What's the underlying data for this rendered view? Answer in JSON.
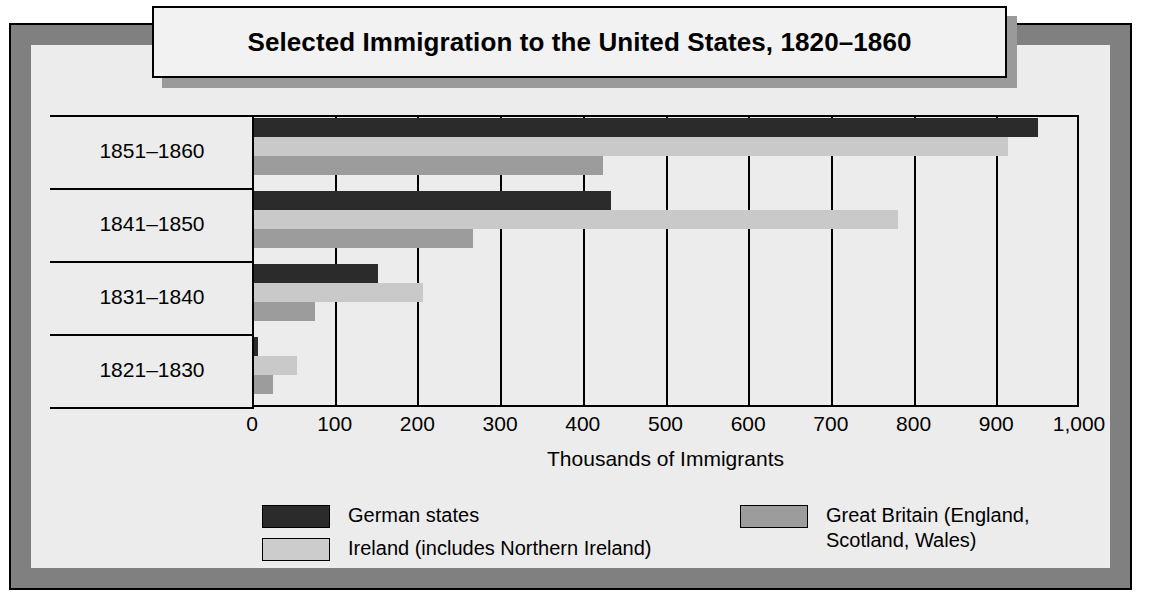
{
  "figure": {
    "title": "Selected Immigration to the United States, 1820–1860"
  },
  "chart_data": {
    "type": "bar",
    "orientation": "horizontal",
    "title": "Selected Immigration to the United States, 1820–1860",
    "subtitle": "",
    "xlabel": "Thousands of Immigrants",
    "ylabel": "",
    "categories": [
      "1851–1860",
      "1841–1850",
      "1831–1840",
      "1821–1830"
    ],
    "series": [
      {
        "name": "German states",
        "color": "#2b2b2b",
        "values": [
          951,
          434,
          152,
          7
        ]
      },
      {
        "name": "Ireland (includes Northern Ireland)",
        "color": "#c9c9c9",
        "values": [
          914,
          781,
          207,
          54
        ]
      },
      {
        "name": "Great Britain (England, Scotland, Wales)",
        "color": "#9c9c9c",
        "values": [
          424,
          267,
          76,
          25
        ]
      }
    ],
    "xlim": [
      0,
      1000
    ],
    "xticks": [
      0,
      100,
      200,
      300,
      400,
      500,
      600,
      700,
      800,
      900,
      1000
    ],
    "xtick_labels": [
      "0",
      "100",
      "200",
      "300",
      "400",
      "500",
      "600",
      "700",
      "800",
      "900",
      "1,000"
    ],
    "grid": "vertical",
    "legend_position": "bottom"
  },
  "legend": {
    "entries": [
      {
        "label": "German states",
        "swatch": "german"
      },
      {
        "label": "Ireland (includes Northern Ireland)",
        "swatch": "ireland"
      },
      {
        "label": "Great Britain (England,\nScotland, Wales)",
        "swatch": "britain"
      }
    ]
  },
  "colors": {
    "german": "#2b2b2b",
    "ireland": "#c9c9c9",
    "britain": "#9c9c9c",
    "frame": "#808080",
    "background": "#ececec"
  }
}
